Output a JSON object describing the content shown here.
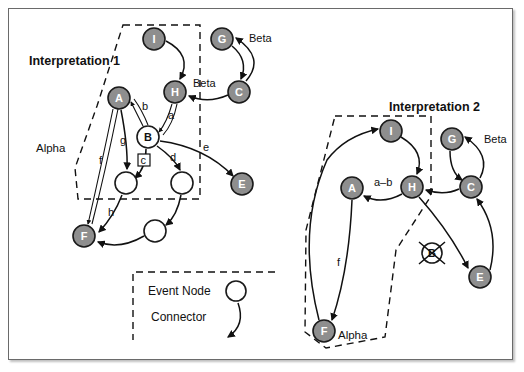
{
  "figure": {
    "title": "",
    "background": "#ffffff",
    "frame_border_color": "#6a6a6a",
    "node_fill": "#8e8e8e",
    "node_stroke": "#111111",
    "open_node_fill": "#ffffff"
  },
  "interpretation1": {
    "title": "Interpretation 1",
    "region_label": "Alpha",
    "nodes": [
      {
        "id": "I",
        "label": "I",
        "type": "filled",
        "cx": 154,
        "cy": 39,
        "r": 11
      },
      {
        "id": "H",
        "label": "H",
        "type": "filled",
        "cx": 175,
        "cy": 92,
        "r": 11
      },
      {
        "id": "G",
        "label": "G",
        "type": "filled",
        "cx": 222,
        "cy": 39,
        "r": 11
      },
      {
        "id": "C",
        "label": "C",
        "type": "filled",
        "cx": 239,
        "cy": 92,
        "r": 11
      },
      {
        "id": "A",
        "label": "A",
        "type": "filled",
        "cx": 119,
        "cy": 98,
        "r": 11
      },
      {
        "id": "B",
        "label": "B",
        "type": "open",
        "cx": 148,
        "cy": 137,
        "r": 11
      },
      {
        "id": "E",
        "label": "E",
        "type": "filled",
        "cx": 242,
        "cy": 184,
        "r": 11
      },
      {
        "id": "F",
        "label": "F",
        "type": "filled",
        "cx": 84,
        "cy": 236,
        "r": 11
      },
      {
        "id": "n1",
        "label": "",
        "type": "open",
        "cx": 126,
        "cy": 183,
        "r": 11
      },
      {
        "id": "n2",
        "label": "",
        "type": "open",
        "cx": 182,
        "cy": 183,
        "r": 11
      },
      {
        "id": "n3",
        "label": "",
        "type": "open",
        "cx": 155,
        "cy": 231,
        "r": 11
      }
    ],
    "edge_labels": [
      {
        "id": "a",
        "text": "a",
        "x": 168,
        "y": 119
      },
      {
        "id": "b",
        "text": "b",
        "x": 142,
        "y": 110
      },
      {
        "id": "c",
        "text": "c",
        "x": 144,
        "y": 163,
        "boxed": true
      },
      {
        "id": "d",
        "text": "d",
        "x": 172,
        "y": 160
      },
      {
        "id": "e",
        "text": "e",
        "x": 204,
        "y": 150
      },
      {
        "id": "f",
        "text": "f",
        "x": 101,
        "y": 163
      },
      {
        "id": "g",
        "text": "g",
        "x": 122,
        "y": 143
      },
      {
        "id": "h",
        "text": "h",
        "x": 110,
        "y": 215
      },
      {
        "id": "beta1",
        "text": "Beta",
        "x": 250,
        "y": 40
      },
      {
        "id": "beta2",
        "text": "Beta",
        "x": 205,
        "y": 87
      }
    ]
  },
  "interpretation2": {
    "title": "Interpretation 2",
    "region_label": "Alpha",
    "nodes": [
      {
        "id": "I",
        "label": "I",
        "type": "filled",
        "cx": 391,
        "cy": 131,
        "r": 11
      },
      {
        "id": "H",
        "label": "H",
        "type": "filled",
        "cx": 412,
        "cy": 187,
        "r": 11
      },
      {
        "id": "G",
        "label": "G",
        "type": "filled",
        "cx": 452,
        "cy": 139,
        "r": 11
      },
      {
        "id": "C",
        "label": "C",
        "type": "filled",
        "cx": 471,
        "cy": 187,
        "r": 11
      },
      {
        "id": "A",
        "label": "A",
        "type": "filled",
        "cx": 352,
        "cy": 188,
        "r": 11
      },
      {
        "id": "B",
        "label": "B",
        "type": "open-crossed",
        "cx": 432,
        "cy": 253,
        "r": 10
      },
      {
        "id": "E",
        "label": "E",
        "type": "filled",
        "cx": 480,
        "cy": 277,
        "r": 11
      },
      {
        "id": "F",
        "label": "F",
        "type": "filled",
        "cx": 324,
        "cy": 331,
        "r": 11
      }
    ],
    "edge_labels": [
      {
        "id": "ab",
        "text": "a–b",
        "x": 382,
        "y": 186
      },
      {
        "id": "f",
        "text": "f",
        "x": 340,
        "y": 265
      },
      {
        "id": "beta",
        "text": "Beta",
        "x": 492,
        "y": 140
      }
    ]
  },
  "legend": {
    "items": [
      {
        "id": "event-node",
        "label": "Event Node",
        "symbol": "circle"
      },
      {
        "id": "connector",
        "label": "Connector",
        "symbol": "arrow"
      }
    ]
  }
}
